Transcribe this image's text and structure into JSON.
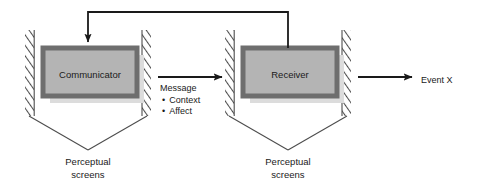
{
  "diagram": {
    "nodes": {
      "communicator": {
        "label": "Communicator"
      },
      "receiver": {
        "label": "Receiver"
      }
    },
    "message": {
      "heading": "Message",
      "bullets": [
        "Context",
        "Affect"
      ],
      "bullet_glyph": "•"
    },
    "outcome": {
      "label": "Event X"
    },
    "screens": {
      "left": {
        "line1": "Perceptual",
        "line2": "screens"
      },
      "right": {
        "line1": "Perceptual",
        "line2": "screens"
      }
    },
    "colors": {
      "box_fill": "#b4b4b4",
      "box_border": "#6e6e6e",
      "box_shadow": "#dcdcdc",
      "hatch_stroke": "#4d4d4d",
      "line": "#1a1a1a",
      "leader": "#4d4d4d",
      "text": "#1a1a1a",
      "background": "#ffffff"
    }
  }
}
